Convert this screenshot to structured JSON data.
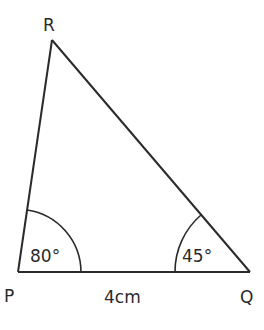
{
  "diagram": {
    "type": "triangle",
    "vertices": [
      {
        "name": "P",
        "label": "P"
      },
      {
        "name": "Q",
        "label": "Q"
      },
      {
        "name": "R",
        "label": "R"
      }
    ],
    "angles": {
      "P": "80°",
      "Q": "45°"
    },
    "sides": {
      "PQ": "4cm"
    },
    "colors": {
      "stroke": "#2a2a2a",
      "background": "#ffffff"
    }
  }
}
